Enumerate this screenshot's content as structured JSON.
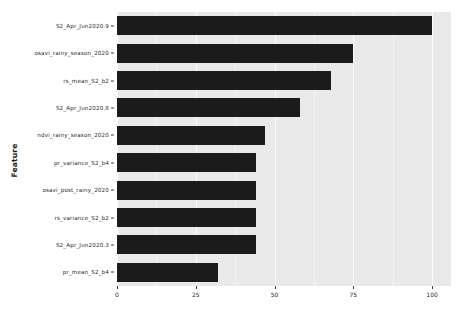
{
  "chart_data": {
    "type": "bar",
    "orientation": "horizontal",
    "title": "",
    "xlabel": "",
    "ylabel": "Feature",
    "xlim": [
      0,
      106
    ],
    "xticks": [
      0,
      25,
      50,
      75,
      100
    ],
    "grid": true,
    "legend": null,
    "bar_color": "#1b1b1b",
    "panel_color": "#e9e9e9",
    "categories": [
      "S2_Apr_Jun2020.9",
      "osavi_rainy_season_2020",
      "rs_mean_S2_b2",
      "S2_Apr_Jun2020.8",
      "ndvi_rainy_season_2020",
      "pr_variance_S2_b4",
      "osavi_post_rainy_2020",
      "rs_variance_S2_b2",
      "S2_Apr_Jun2020.3",
      "pr_mean_S2_b4"
    ],
    "values": [
      100,
      75,
      68,
      58,
      47,
      44,
      44,
      44,
      44,
      32
    ]
  }
}
